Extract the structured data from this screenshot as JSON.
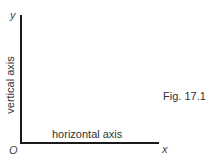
{
  "figure": {
    "caption": "Fig. 17.1",
    "axes": {
      "y_symbol": "y",
      "x_symbol": "x",
      "origin_symbol": "O",
      "vertical_label": "vertical axis",
      "horizontal_label": "horizontal axis"
    },
    "colors": {
      "axis_line": "#1a1a1a",
      "text": "#333333",
      "background": "#ffffff"
    }
  }
}
